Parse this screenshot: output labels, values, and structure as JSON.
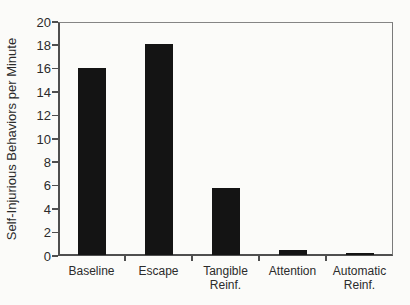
{
  "figure": {
    "background": "#fbfbf9",
    "frame_color": "#4f4f4f",
    "bar_color": "#141414",
    "text_color": "#2b2b2b"
  },
  "chart_data": {
    "type": "bar",
    "ylabel": "Self-Injurious Behaviors per Minute",
    "xlabel": "",
    "categories": [
      "Baseline",
      "Escape",
      "Tangible\nReinf.",
      "Attention",
      "Automatic\nReinf."
    ],
    "values": [
      16,
      18,
      5.7,
      0.4,
      0.2
    ],
    "ylim": [
      0,
      20
    ],
    "ytick_step": 2,
    "grid": "off",
    "legend": "none",
    "bar_count": 5
  }
}
